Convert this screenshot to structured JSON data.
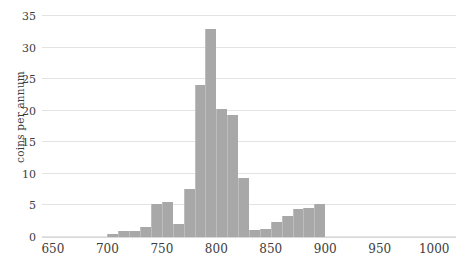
{
  "chart_data": {
    "type": "bar",
    "title": "",
    "subtitle": "",
    "xlabel": "",
    "ylabel": "coins per annum",
    "xlim": [
      640,
      1020
    ],
    "ylim": [
      0,
      35
    ],
    "grid": true,
    "legend": false,
    "bar_color": "#a8a8a8",
    "grid_color": "#e3e3e3",
    "text_color": "#3c3c3c",
    "bin_width": 10,
    "yticks": [
      0,
      5,
      10,
      15,
      20,
      25,
      30,
      35
    ],
    "ytick_labels": [
      "0",
      "5",
      "10",
      "15",
      "20",
      "25",
      "30",
      "35"
    ],
    "xticks": [
      650,
      700,
      750,
      800,
      850,
      900,
      950,
      1000
    ],
    "xtick_labels": [
      "650",
      "700",
      "750",
      "800",
      "850",
      "900",
      "950",
      "1000"
    ],
    "bins": [
      {
        "start": 700,
        "end": 710,
        "value": 0.4
      },
      {
        "start": 710,
        "end": 720,
        "value": 1
      },
      {
        "start": 720,
        "end": 730,
        "value": 1
      },
      {
        "start": 730,
        "end": 740,
        "value": 1.6
      },
      {
        "start": 740,
        "end": 750,
        "value": 5.2
      },
      {
        "start": 750,
        "end": 760,
        "value": 5.5
      },
      {
        "start": 760,
        "end": 770,
        "value": 2
      },
      {
        "start": 770,
        "end": 780,
        "value": 7.6
      },
      {
        "start": 780,
        "end": 790,
        "value": 24
      },
      {
        "start": 790,
        "end": 800,
        "value": 33
      },
      {
        "start": 800,
        "end": 810,
        "value": 20.2
      },
      {
        "start": 810,
        "end": 820,
        "value": 19.4
      },
      {
        "start": 820,
        "end": 830,
        "value": 9.3
      },
      {
        "start": 830,
        "end": 840,
        "value": 1.1
      },
      {
        "start": 840,
        "end": 850,
        "value": 1.2
      },
      {
        "start": 850,
        "end": 860,
        "value": 2.3
      },
      {
        "start": 860,
        "end": 870,
        "value": 3.3
      },
      {
        "start": 870,
        "end": 880,
        "value": 4.4
      },
      {
        "start": 880,
        "end": 890,
        "value": 4.6
      },
      {
        "start": 890,
        "end": 900,
        "value": 5.2
      }
    ]
  }
}
